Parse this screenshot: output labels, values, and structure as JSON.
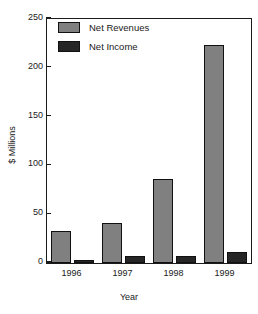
{
  "chart_data": {
    "type": "bar",
    "title": "",
    "xlabel": "Year",
    "ylabel": "$ Millions",
    "categories": [
      "1996",
      "1997",
      "1998",
      "1999"
    ],
    "series": [
      {
        "name": "Net Revenues",
        "color": "#808080",
        "values": [
          33,
          41,
          86,
          223
        ]
      },
      {
        "name": "Net Income",
        "color": "#262626",
        "values": [
          3,
          7,
          7,
          11
        ]
      }
    ],
    "ylim": [
      0,
      250
    ],
    "yticks": [
      0,
      50,
      100,
      150,
      200,
      250
    ],
    "ytick_labels": [
      "0",
      "50",
      "100",
      "150",
      "200",
      "250"
    ],
    "grid": false,
    "legend_position": "top-left",
    "legend_entries": [
      "Net Revenues",
      "Net Income"
    ]
  },
  "axes": {
    "x_title": "Year",
    "y_title": "$ Millions"
  }
}
